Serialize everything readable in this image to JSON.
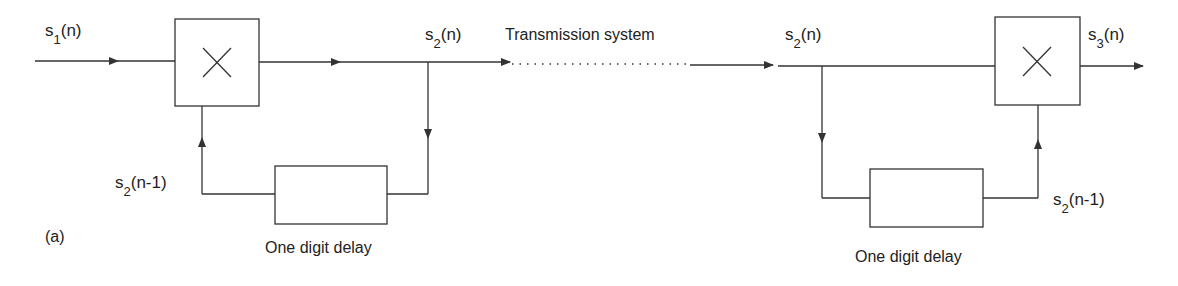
{
  "diagram": {
    "colors": {
      "line": "#333333",
      "text": "#222222",
      "background": "#ffffff"
    },
    "panel_label": "(a)",
    "transmitter": {
      "input_label": {
        "base": "s",
        "sub": "1",
        "arg": "(n)"
      },
      "output_label": {
        "base": "s",
        "sub": "2",
        "arg": "(n)"
      },
      "feedback_label": {
        "base": "s",
        "sub": "2",
        "arg": "(n-1)"
      },
      "multiplier_symbol": "×",
      "delay_caption": "One digit delay"
    },
    "channel": {
      "label": "Transmission system"
    },
    "receiver": {
      "input_label": {
        "base": "s",
        "sub": "2",
        "arg": "(n)"
      },
      "output_label": {
        "base": "s",
        "sub": "3",
        "arg": "(n)"
      },
      "feedback_label": {
        "base": "s",
        "sub": "2",
        "arg": "(n-1)"
      },
      "multiplier_symbol": "×",
      "delay_caption": "One digit delay"
    }
  }
}
